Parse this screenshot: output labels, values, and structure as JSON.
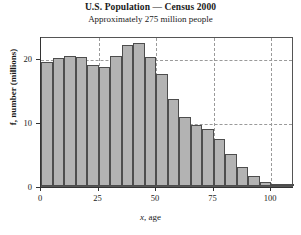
{
  "chart_data": {
    "type": "bar",
    "title": "U.S. Population — Census 2000",
    "subtitle": "Approximately 275 million people",
    "xlabel": "x, age",
    "ylabel": "f, number (millions)",
    "xlabel_italic": "x",
    "xlabel_rest": ", age",
    "ylabel_italic": "f",
    "ylabel_rest": ", number (millions)",
    "bin_width": 5,
    "xlim": [
      0,
      110
    ],
    "ylim": [
      0,
      23.5
    ],
    "xticks": [
      0,
      25,
      50,
      75,
      100
    ],
    "yticks": [
      0,
      10,
      20
    ],
    "xtick_labels": [
      "0",
      "25",
      "50",
      "75",
      "100"
    ],
    "ytick_labels": [
      "0",
      "10",
      "20"
    ],
    "grid": "dashed-both",
    "legend": "none",
    "bar_color": "#b3b3b3",
    "bar_edge_color": "#4d4d4d",
    "categories": [
      "0-4",
      "5-9",
      "10-14",
      "15-19",
      "20-24",
      "25-29",
      "30-34",
      "35-39",
      "40-44",
      "45-49",
      "50-54",
      "55-59",
      "60-64",
      "65-69",
      "70-74",
      "75-79",
      "80-84",
      "85-89",
      "90-94",
      "95-99",
      "100-104",
      "105-109"
    ],
    "bin_starts": [
      0,
      5,
      10,
      15,
      20,
      25,
      30,
      35,
      40,
      45,
      50,
      55,
      60,
      65,
      70,
      75,
      80,
      85,
      90,
      95,
      100,
      105
    ],
    "values": [
      19.4,
      20.1,
      20.3,
      20.2,
      18.9,
      18.6,
      20.3,
      22.1,
      22.4,
      20.2,
      17.6,
      13.6,
      10.8,
      9.5,
      8.9,
      7.4,
      5.0,
      3.0,
      1.5,
      0.7,
      0.35,
      0.25
    ]
  }
}
